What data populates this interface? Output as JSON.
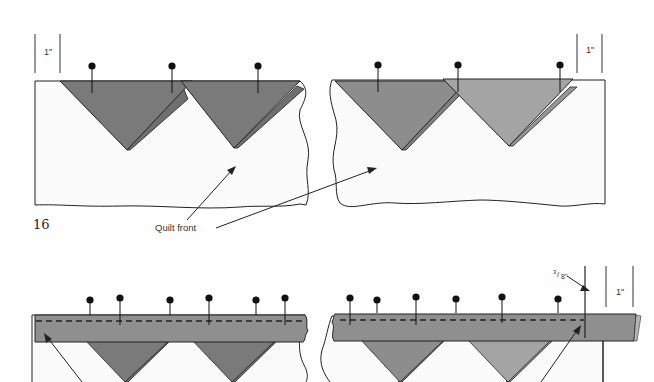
{
  "figure": {
    "step_number": "16",
    "top_panel": {
      "measure_left": "1\"",
      "measure_right": "1\"",
      "callout": "Quilt front"
    },
    "bottom_panel": {
      "seam_label": "3/8\"",
      "seam_label_sup": "3",
      "seam_label_sub": "8\"",
      "measure_right": "1\""
    }
  },
  "colors": {
    "dark_triangle": "#7a7a7a",
    "mid_triangle": "#8d8d8d",
    "light_triangle": "#a4a4a4",
    "binding": "#8f8f8f",
    "line": "#222222",
    "fabric": "#fbfbfb"
  }
}
